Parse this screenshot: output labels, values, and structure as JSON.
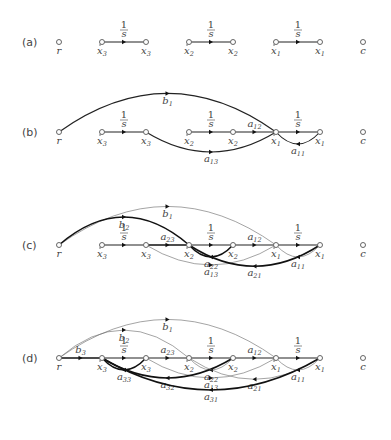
{
  "figure": {
    "node_x": {
      "r": 59,
      "xd3": 102,
      "x3": 146,
      "xd2": 189,
      "x2": 233,
      "xd1": 276,
      "x1": 320,
      "c": 363
    },
    "node_labels": {
      "r": {
        "base": "r",
        "sub": "",
        "dot": false
      },
      "xd3": {
        "base": "x",
        "sub": "3",
        "dot": true
      },
      "x3": {
        "base": "x",
        "sub": "3",
        "dot": false
      },
      "xd2": {
        "base": "x",
        "sub": "2",
        "dot": true
      },
      "x2": {
        "base": "x",
        "sub": "2",
        "dot": false
      },
      "xd1": {
        "base": "x",
        "sub": "1",
        "dot": true
      },
      "x1": {
        "base": "x",
        "sub": "1",
        "dot": false
      },
      "c": {
        "base": "c",
        "sub": "",
        "dot": false
      }
    },
    "integrator_label": {
      "num": "1",
      "den": "s"
    },
    "panels": [
      {
        "id": "a",
        "label": "(a)",
        "y": 42,
        "edges": [
          {
            "from": "xd3",
            "to": "x3",
            "type": "straight",
            "label": "1/s"
          },
          {
            "from": "xd2",
            "to": "x2",
            "type": "straight",
            "label": "1/s"
          },
          {
            "from": "xd1",
            "to": "x1",
            "type": "straight",
            "label": "1/s"
          }
        ]
      },
      {
        "id": "b",
        "label": "(b)",
        "y": 132,
        "edges": [
          {
            "from": "xd3",
            "to": "x3",
            "type": "straight",
            "label": "1/s"
          },
          {
            "from": "xd2",
            "to": "x2",
            "type": "straight",
            "label": "1/s"
          },
          {
            "from": "x2",
            "to": "xd1",
            "type": "straight",
            "label": "a",
            "sub": "12"
          },
          {
            "from": "xd1",
            "to": "x1",
            "type": "straight",
            "label": "1/s"
          },
          {
            "from": "r",
            "to": "xd1",
            "type": "arc-up",
            "label": "b",
            "sub": "1",
            "height": 58
          },
          {
            "from": "x3",
            "to": "xd1",
            "type": "arc-down",
            "label": "a",
            "sub": "13",
            "height": 30
          },
          {
            "from": "x1",
            "to": "xd1",
            "type": "loop-down",
            "label": "a",
            "sub": "11",
            "height": 18
          }
        ]
      },
      {
        "id": "c",
        "label": "(c)",
        "y": 245,
        "edges": [
          {
            "from": "xd3",
            "to": "x3",
            "type": "straight",
            "label": "1/s"
          },
          {
            "from": "x3",
            "to": "xd2",
            "type": "straight",
            "label": "a",
            "sub": "23",
            "bold": true
          },
          {
            "from": "xd2",
            "to": "x2",
            "type": "straight",
            "label": "1/s"
          },
          {
            "from": "x2",
            "to": "xd1",
            "type": "straight",
            "label": "a",
            "sub": "12"
          },
          {
            "from": "xd1",
            "to": "x1",
            "type": "straight",
            "label": "1/s"
          },
          {
            "from": "r",
            "to": "xd1",
            "type": "arc-up",
            "label": "b",
            "sub": "1",
            "height": 58,
            "thin": true
          },
          {
            "from": "r",
            "to": "xd2",
            "type": "arc-up",
            "label": "b",
            "sub": "2",
            "height": 42,
            "bold": true
          },
          {
            "from": "x3",
            "to": "xd1",
            "type": "arc-down",
            "label": "a",
            "sub": "13",
            "height": 30,
            "thin": true
          },
          {
            "from": "x2",
            "to": "xd2",
            "type": "loop-down",
            "label": "a",
            "sub": "22",
            "height": 18,
            "bold": true
          },
          {
            "from": "x1",
            "to": "xd2",
            "type": "arc-down",
            "label": "a",
            "sub": "21",
            "height": 32,
            "bold": true
          },
          {
            "from": "x1",
            "to": "xd1",
            "type": "loop-down",
            "label": "a",
            "sub": "11",
            "height": 18,
            "thin": true
          }
        ]
      },
      {
        "id": "d",
        "label": "(d)",
        "y": 358,
        "edges": [
          {
            "from": "r",
            "to": "xd3",
            "type": "straight",
            "label": "b",
            "sub": "3",
            "bold": true
          },
          {
            "from": "xd3",
            "to": "x3",
            "type": "straight",
            "label": "1/s"
          },
          {
            "from": "x3",
            "to": "xd2",
            "type": "straight",
            "label": "a",
            "sub": "23"
          },
          {
            "from": "xd2",
            "to": "x2",
            "type": "straight",
            "label": "1/s"
          },
          {
            "from": "x2",
            "to": "xd1",
            "type": "straight",
            "label": "a",
            "sub": "12"
          },
          {
            "from": "xd1",
            "to": "x1",
            "type": "straight",
            "label": "1/s"
          },
          {
            "from": "r",
            "to": "xd1",
            "type": "arc-up",
            "label": "b",
            "sub": "1",
            "height": 58,
            "thin": true
          },
          {
            "from": "r",
            "to": "xd2",
            "type": "arc-up",
            "label": "b",
            "sub": "2",
            "height": 42,
            "thin": true
          },
          {
            "from": "x3",
            "to": "xd3",
            "type": "loop-down",
            "label": "a",
            "sub": "33",
            "height": 18,
            "bold": true
          },
          {
            "from": "x3",
            "to": "xd1",
            "type": "arc-down",
            "label": "a",
            "sub": "13",
            "height": 30,
            "thin": true
          },
          {
            "from": "x2",
            "to": "xd2",
            "type": "loop-down",
            "label": "a",
            "sub": "22",
            "height": 18,
            "thin": true
          },
          {
            "from": "x2",
            "to": "xd3",
            "type": "arc-down",
            "label": "a",
            "sub": "32",
            "height": 30,
            "bold": true
          },
          {
            "from": "x1",
            "to": "xd2",
            "type": "arc-down",
            "label": "a",
            "sub": "21",
            "height": 32,
            "thin": true
          },
          {
            "from": "x1",
            "to": "xd3",
            "type": "arc-down",
            "label": "a",
            "sub": "31",
            "height": 48,
            "bold": true
          },
          {
            "from": "x1",
            "to": "xd1",
            "type": "loop-down",
            "label": "a",
            "sub": "11",
            "height": 18,
            "thin": true
          }
        ]
      }
    ]
  }
}
